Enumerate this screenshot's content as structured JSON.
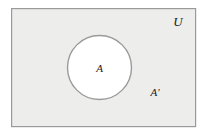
{
  "figure": {
    "kind": "venn-diagram",
    "title": "",
    "canvas": {
      "width": 206,
      "height": 135,
      "background": "#ffffff"
    },
    "universe_rect": {
      "label": "U",
      "meaning": "universal set",
      "x": 11,
      "y": 8,
      "width": 185,
      "height": 119,
      "fill": "#ededeb",
      "stroke": "#9a9a9a",
      "stroke_width": 1.2
    },
    "set_circle": {
      "label": "A",
      "meaning": "set A",
      "cx": 99.5,
      "cy": 67.5,
      "r": 32,
      "fill": "#ffffff",
      "stroke": "#9a9a9a",
      "stroke_width": 1.4
    },
    "complement_region": {
      "label": "A′",
      "meaning": "complement of A"
    },
    "labels": [
      {
        "name": "universe-label",
        "text": "U",
        "x": 178,
        "y": 26,
        "font_size": 13
      },
      {
        "name": "set-a-label",
        "text": "A",
        "x": 99.5,
        "y": 72,
        "font_size": 11
      },
      {
        "name": "complement-label",
        "text": "A′",
        "x": 155,
        "y": 96,
        "font_size": 11
      }
    ],
    "colors": {
      "universe_fill": "#ededeb",
      "circle_fill": "#ffffff",
      "stroke": "#9a9a9a",
      "text": "#1a1a1a",
      "page_background": "#ffffff"
    }
  }
}
